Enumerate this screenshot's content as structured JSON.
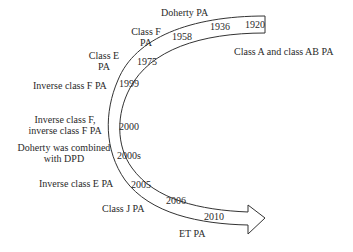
{
  "diagram": {
    "colors": {
      "line": "#333333",
      "text": "#2a2a2a",
      "background": "#ffffff"
    },
    "years": {
      "y1920": "1920",
      "y1936": "1936",
      "y1958": "1958",
      "y1975": "1975",
      "y1999": "1999",
      "y2000": "2000",
      "y2000s": "2000s",
      "y2005": "2005",
      "y2006": "2006",
      "y2010": "2010"
    },
    "labels": {
      "class_a_ab": "Class A and class AB PA",
      "doherty": "Doherty PA",
      "class_f_l1": "Class F",
      "class_f_l2": "PA",
      "class_e_l1": "Class E",
      "class_e_l2": "PA",
      "inverse_f": "Inverse class F PA",
      "inv_f_combo_l1": "Inverse class F,",
      "inv_f_combo_l2": "inverse class F PA",
      "doherty_dpd_l1": "Doherty was combined",
      "doherty_dpd_l2": "with DPD",
      "inverse_e": "Inverse class E PA",
      "class_j": "Class J PA",
      "et": "ET PA"
    }
  }
}
